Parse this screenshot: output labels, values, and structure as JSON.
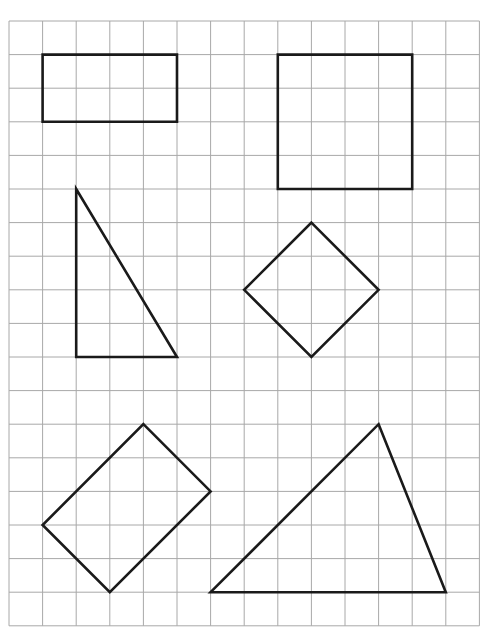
{
  "grid": {
    "cols": 14,
    "rows": 18,
    "origin_x": 9,
    "origin_y": 21,
    "cell": 33.6,
    "line_color": "#a8a8a8",
    "background": "#ffffff"
  },
  "shapes": [
    {
      "name": "rectangle-2x4",
      "type": "polygon",
      "points": [
        [
          1,
          1
        ],
        [
          5,
          1
        ],
        [
          5,
          3
        ],
        [
          1,
          3
        ]
      ]
    },
    {
      "name": "square-4x4",
      "type": "polygon",
      "points": [
        [
          8,
          1
        ],
        [
          12,
          1
        ],
        [
          12,
          5
        ],
        [
          8,
          5
        ]
      ]
    },
    {
      "name": "right-triangle",
      "type": "polygon",
      "points": [
        [
          2,
          5
        ],
        [
          5,
          10
        ],
        [
          2,
          10
        ]
      ]
    },
    {
      "name": "diamond-square",
      "type": "polygon",
      "points": [
        [
          9,
          6
        ],
        [
          11,
          8
        ],
        [
          9,
          10
        ],
        [
          7,
          8
        ]
      ]
    },
    {
      "name": "rotated-rectangle",
      "type": "polygon",
      "points": [
        [
          4,
          12
        ],
        [
          6,
          14
        ],
        [
          3,
          17
        ],
        [
          1,
          15
        ]
      ]
    },
    {
      "name": "scalene-triangle",
      "type": "polygon",
      "points": [
        [
          11,
          12
        ],
        [
          13,
          17
        ],
        [
          6,
          17
        ]
      ]
    }
  ],
  "style": {
    "shape_stroke": "#1a1a1a",
    "shape_stroke_width": 2.6
  }
}
